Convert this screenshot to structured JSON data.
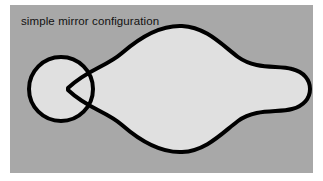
{
  "figure": {
    "caption": "simple mirror configuration",
    "panel": {
      "background_color": "#a8a8a8",
      "outer_background_color": "#ffffff",
      "x": 10,
      "y": 5,
      "width": 303,
      "height": 168
    },
    "style": {
      "fill_color": "#e0e0e0",
      "stroke_color": "#000000",
      "stroke_width": 4,
      "text_color": "#111111"
    },
    "shapes": [
      {
        "name": "plasma-body",
        "kind": "closed-curve",
        "description": "large peanut/lens shaped plasma column with S-curved top and bottom edges flaring into a bulbous rounded right end",
        "fill": "#e0e0e0",
        "stroke": "#000000",
        "path": "M 58 83 C 78 64 96 62 112 48 C 128 34 150 20 172 21 C 196 22 212 40 228 52 C 246 65 268 60 282 64 C 294 67 300 75 300 84 C 300 93 294 101 282 104 C 268 108 246 103 228 116 C 212 128 196 146 172 147 C 150 148 128 134 112 120 C 96 106 78 104 58 85 Z"
      },
      {
        "name": "mirror-coil-circle",
        "kind": "circle",
        "description": "small circle overlapping the left neck of the plasma body",
        "fill": "#e0e0e0",
        "stroke": "#000000",
        "cx": 51,
        "cy": 84,
        "r": 32
      }
    ]
  }
}
